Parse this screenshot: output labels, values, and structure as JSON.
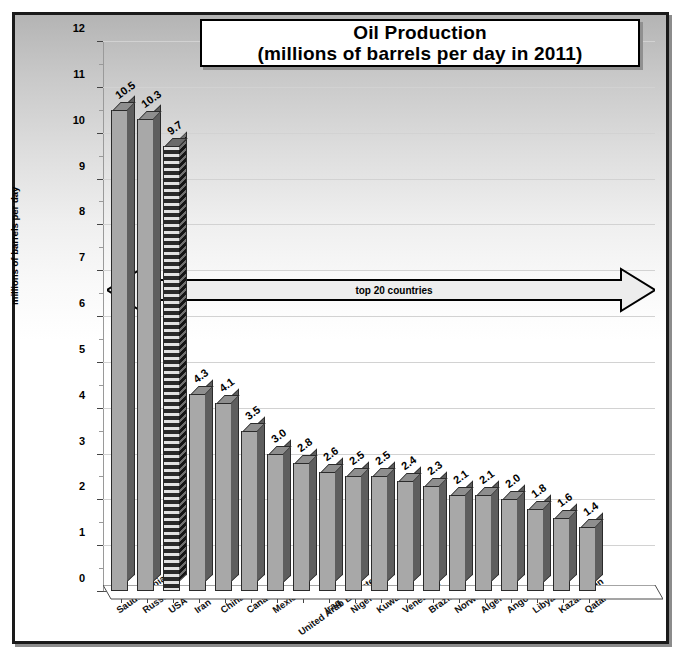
{
  "chart_data": {
    "type": "bar",
    "title": "Oil Production",
    "subtitle": "(millions of barrels per day in 2011)",
    "title_line1": "Oil Production",
    "title_line2": "(millions of barrels per day in 2011)",
    "xlabel": "",
    "ylabel": "millions of barrels per day",
    "ylim": [
      0,
      12
    ],
    "ytick_labels": [
      "0",
      "1",
      "2",
      "3",
      "4",
      "5",
      "6",
      "7",
      "8",
      "9",
      "10",
      "11",
      "12"
    ],
    "yticks": [
      0,
      1,
      2,
      3,
      4,
      5,
      6,
      7,
      8,
      9,
      10,
      11,
      12
    ],
    "grid": true,
    "legend": "none",
    "categories": [
      "Saudi Arabia*",
      "Russia*",
      "USA*",
      "Iran",
      "China*",
      "Canada*",
      "Mexico*",
      "United Arab Emirates",
      "Iraq",
      "Nigeria",
      "Kuwait",
      "Venezuela",
      "Brazil*",
      "Norway",
      "Algeria",
      "Angola",
      "Libya",
      "Kazakhstan",
      "Qatar"
    ],
    "values": [
      10.5,
      10.3,
      9.7,
      4.3,
      4.1,
      3.5,
      3.0,
      2.8,
      2.6,
      2.5,
      2.5,
      2.4,
      2.3,
      2.1,
      2.1,
      2.0,
      1.8,
      1.6,
      1.4
    ],
    "value_labels": [
      "10.5",
      "10.3",
      "9.7",
      "4.3",
      "4.1",
      "3.5",
      "3.0",
      "2.8",
      "2.6",
      "2.5",
      "2.5",
      "2.4",
      "2.3",
      "2.1",
      "2.1",
      "2.0",
      "1.8",
      "1.6",
      "1.4"
    ],
    "highlighted_category": "USA*",
    "highlight_style": "hatched",
    "annotations": [
      {
        "text": "top 20 countries",
        "type": "double-headed-arrow",
        "y_value": 6.8
      }
    ],
    "colors": {
      "bar_face": "#a8a8a8",
      "bar_side": "#5e5e5e",
      "bar_top": "#8e8e8e",
      "outline": "#2b2b2b",
      "gridline": "#d2d2d2",
      "background_top": "#b4b4b4",
      "background_bottom": "#ffffff",
      "text": "#000000"
    }
  },
  "caption": ""
}
